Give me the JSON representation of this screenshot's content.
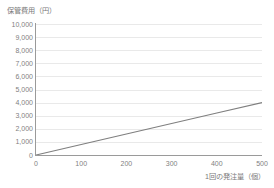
{
  "chart_data": {
    "type": "line",
    "title": "",
    "xlabel": "1回の発注量（個）",
    "ylabel": "保管費用（円）",
    "xlim": [
      0,
      500
    ],
    "ylim": [
      0,
      10000
    ],
    "grid": true,
    "legend": "none",
    "x_ticks": [
      "0",
      "100",
      "200",
      "300",
      "400",
      "500"
    ],
    "x_tick_values": [
      0,
      100,
      200,
      300,
      400,
      500
    ],
    "y_ticks": [
      "0",
      "1,000",
      "2,000",
      "3,000",
      "4,000",
      "5,000",
      "6,000",
      "7,000",
      "8,000",
      "9,000",
      "10,000"
    ],
    "y_tick_values": [
      0,
      1000,
      2000,
      3000,
      4000,
      5000,
      6000,
      7000,
      8000,
      9000,
      10000
    ],
    "series": [
      {
        "name": "保管費用",
        "color": "#7f7f7f",
        "x": [
          0,
          100,
          200,
          300,
          400,
          500
        ],
        "values": [
          0,
          800,
          1600,
          2400,
          3200,
          4000
        ]
      }
    ]
  },
  "colors": {
    "line": "#7f7f7f",
    "grid": "#e9e9e9",
    "axis": "#9a9a9a",
    "text": "#7f7f7f",
    "background": "#ffffff"
  }
}
